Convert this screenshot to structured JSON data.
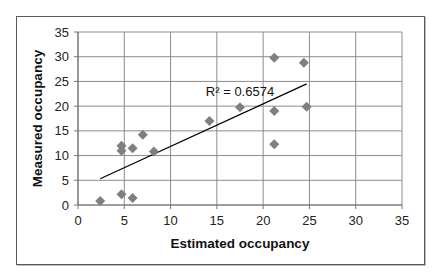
{
  "chart_data": {
    "type": "scatter",
    "title": "",
    "xlabel": "Estimated occupancy",
    "ylabel": "Measured occupancy",
    "xlim": [
      0,
      35
    ],
    "ylim": [
      0,
      35
    ],
    "xticks": [
      0,
      5,
      10,
      15,
      20,
      25,
      30,
      35
    ],
    "yticks": [
      0,
      5,
      10,
      15,
      20,
      25,
      30,
      35
    ],
    "grid": true,
    "legend": "none",
    "marker": "diamond",
    "marker_color": "#7f7f7f",
    "line_color": "#000000",
    "series": [
      {
        "name": "Occupancy",
        "points": [
          {
            "x": 2.4,
            "y": 0.8
          },
          {
            "x": 4.7,
            "y": 12.0
          },
          {
            "x": 4.7,
            "y": 11.0
          },
          {
            "x": 4.7,
            "y": 2.2
          },
          {
            "x": 5.9,
            "y": 11.5
          },
          {
            "x": 5.9,
            "y": 1.4
          },
          {
            "x": 7.0,
            "y": 14.2
          },
          {
            "x": 8.2,
            "y": 10.8
          },
          {
            "x": 14.2,
            "y": 17.0
          },
          {
            "x": 17.5,
            "y": 19.8
          },
          {
            "x": 21.2,
            "y": 29.8
          },
          {
            "x": 21.2,
            "y": 19.0
          },
          {
            "x": 21.2,
            "y": 12.3
          },
          {
            "x": 24.4,
            "y": 28.8
          },
          {
            "x": 24.7,
            "y": 19.9
          }
        ]
      }
    ],
    "trendline": {
      "type": "linear",
      "x_start": 2.4,
      "y_start": 5.3,
      "x_end": 24.7,
      "y_end": 24.5
    },
    "annotations": [
      {
        "text": "R² = 0.6574",
        "x": 17.5,
        "y": 22.0
      }
    ]
  }
}
